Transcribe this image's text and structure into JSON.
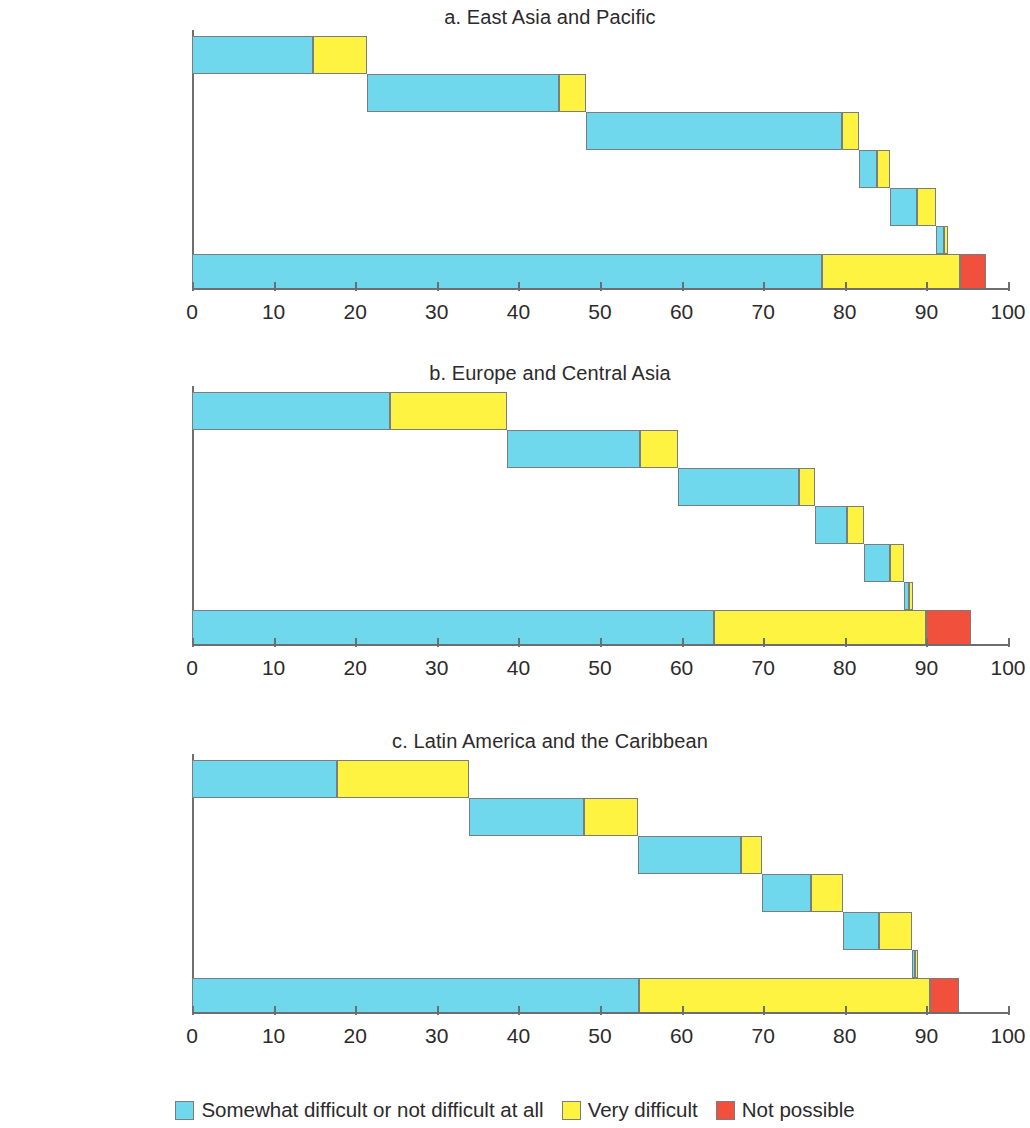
{
  "chart_data": {
    "type": "bar",
    "subtype": "stacked-horizontal-floating",
    "title": "",
    "xlabel": "",
    "ylabel": "",
    "xlim": [
      0,
      100
    ],
    "xticks": [
      0,
      10,
      20,
      30,
      40,
      50,
      60,
      70,
      80,
      90,
      100
    ],
    "xtick_labels": [
      "0",
      "10",
      "20",
      "30",
      "40",
      "50",
      "60",
      "70",
      "80",
      "90",
      "100"
    ],
    "grid": false,
    "legend_position": "bottom-center",
    "categories": [
      "Family or friends",
      "Work",
      "Savings",
      "Borrowing",
      "Selling assets",
      "Other",
      "Any source"
    ],
    "series": [
      {
        "name": "Somewhat difficult or not difficult at all",
        "color": "#6fd8ec"
      },
      {
        "name": "Very difficult",
        "color": "#fdf340"
      },
      {
        "name": "Not possible",
        "color": "#f0503c"
      }
    ],
    "panels": [
      {
        "id": "a",
        "title": "a. East Asia and Pacific",
        "bars": [
          {
            "category": "Family or friends",
            "start": 0.0,
            "segments": [
              14.8,
              6.7,
              0
            ]
          },
          {
            "category": "Work",
            "start": 21.5,
            "segments": [
              23.5,
              3.3,
              0
            ]
          },
          {
            "category": "Savings",
            "start": 48.3,
            "segments": [
              31.3,
              2.2,
              0
            ]
          },
          {
            "category": "Borrowing",
            "start": 81.8,
            "segments": [
              2.1,
              1.7,
              0
            ]
          },
          {
            "category": "Selling assets",
            "start": 85.6,
            "segments": [
              3.2,
              2.4,
              0
            ]
          },
          {
            "category": "Other",
            "start": 91.2,
            "segments": [
              0.9,
              0.5,
              0
            ]
          },
          {
            "category": "Any source",
            "start": 0.0,
            "segments": [
              77.2,
              16.9,
              3.2
            ]
          }
        ]
      },
      {
        "id": "b",
        "title": "b. Europe and Central Asia",
        "bars": [
          {
            "category": "Family or friends",
            "start": 0.0,
            "segments": [
              24.3,
              14.3,
              0
            ]
          },
          {
            "category": "Work",
            "start": 38.6,
            "segments": [
              16.3,
              4.7,
              0
            ]
          },
          {
            "category": "Savings",
            "start": 59.6,
            "segments": [
              14.8,
              2.0,
              0
            ]
          },
          {
            "category": "Borrowing",
            "start": 76.4,
            "segments": [
              3.9,
              2.1,
              0
            ]
          },
          {
            "category": "Selling assets",
            "start": 82.4,
            "segments": [
              3.2,
              1.6,
              0
            ]
          },
          {
            "category": "Other",
            "start": 87.2,
            "segments": [
              0.7,
              0.5,
              0
            ]
          },
          {
            "category": "Any source",
            "start": 0.0,
            "segments": [
              64.0,
              26.0,
              5.5
            ]
          }
        ]
      },
      {
        "id": "c",
        "title": "c. Latin America and the Caribbean",
        "bars": [
          {
            "category": "Family or friends",
            "start": 0.0,
            "segments": [
              17.8,
              16.2,
              0
            ]
          },
          {
            "category": "Work",
            "start": 34.0,
            "segments": [
              14.0,
              6.6,
              0
            ]
          },
          {
            "category": "Savings",
            "start": 54.6,
            "segments": [
              12.7,
              2.5,
              0
            ]
          },
          {
            "category": "Borrowing",
            "start": 69.8,
            "segments": [
              6.0,
              4.0,
              0
            ]
          },
          {
            "category": "Selling assets",
            "start": 79.8,
            "segments": [
              4.4,
              4.0,
              0
            ]
          },
          {
            "category": "Other",
            "start": 88.2,
            "segments": [
              0.4,
              0.4,
              0
            ]
          },
          {
            "category": "Any source",
            "start": 0.0,
            "segments": [
              54.8,
              35.7,
              3.5
            ]
          }
        ]
      }
    ]
  },
  "legend": {
    "items": [
      {
        "label": "Somewhat difficult or not difficult at all",
        "color": "#6fd8ec"
      },
      {
        "label": "Very difficult",
        "color": "#fdf340"
      },
      {
        "label": "Not possible",
        "color": "#f0503c"
      }
    ]
  },
  "axis": {
    "tick_labels": [
      "0",
      "10",
      "20",
      "30",
      "40",
      "50",
      "60",
      "70",
      "80",
      "90",
      "100"
    ]
  },
  "panel_titles": {
    "a": "a. East Asia and Pacific",
    "b": "b. Europe and Central Asia",
    "c": "c. Latin America and the Caribbean"
  },
  "category_labels": [
    "Family or friends",
    "Work",
    "Savings",
    "Borrowing",
    "Selling assets",
    "Other",
    "Any source"
  ]
}
